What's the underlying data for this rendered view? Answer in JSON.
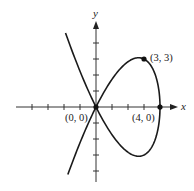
{
  "chart_data": {
    "type": "line",
    "title": "",
    "xlabel": "x",
    "ylabel": "y",
    "xlim": [
      -5,
      5.1
    ],
    "ylim": [
      -4.7,
      5.2
    ],
    "grid": false,
    "x_ticks": [
      -4,
      -3,
      -2,
      -1,
      1,
      2,
      3,
      4
    ],
    "y_ticks": [
      -4,
      -3,
      -2,
      -1,
      1,
      2,
      3,
      4
    ],
    "series": [
      {
        "name": "parametric curve",
        "parametric": "x = 4 - t^2, y = t^3 - 4t",
        "t_range": [
          -2.4,
          2.43
        ],
        "color": "#1a1a1a"
      }
    ],
    "points": [
      {
        "x": 0,
        "y": 0,
        "label": "(0, 0)"
      },
      {
        "x": 3,
        "y": 3,
        "label": "(3, 3)"
      },
      {
        "x": 4,
        "y": 0,
        "label": "(4, 0)"
      }
    ]
  }
}
